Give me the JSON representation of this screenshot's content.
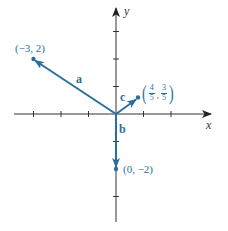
{
  "figure": {
    "type": "vector-diagram",
    "axes": {
      "x_label": "x",
      "y_label": "y",
      "origin_px": [
        116,
        114
      ],
      "unit_px": 27.5,
      "x_ticks": [
        -3,
        -2,
        -1,
        1,
        2
      ],
      "y_ticks": [
        3,
        2,
        1,
        -1,
        -2,
        -3
      ],
      "axis_color": "#333333"
    },
    "vectors": [
      {
        "name": "a",
        "from": [
          0,
          0
        ],
        "to": [
          -3,
          2
        ],
        "point_label": "(−3, 2)"
      },
      {
        "name": "b",
        "from": [
          0,
          0
        ],
        "to": [
          0,
          -2
        ],
        "point_label": "(0, −2)"
      },
      {
        "name": "c",
        "from": [
          0,
          0
        ],
        "to": [
          0.8,
          0.6
        ],
        "point_label_parts": {
          "open": "(",
          "x_num": "4",
          "x_den": "5",
          "sep": ",",
          "y_num": "3",
          "y_den": "5",
          "close": ")"
        }
      }
    ],
    "vector_color": "#2b6e9e"
  }
}
